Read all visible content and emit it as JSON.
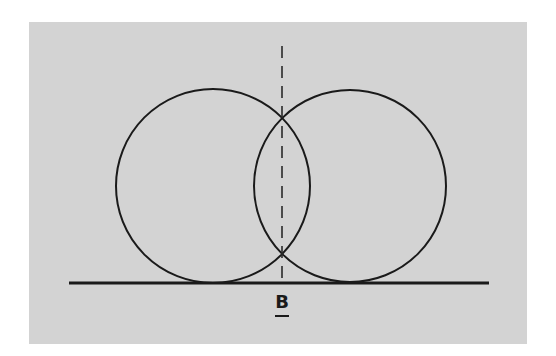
{
  "figure": {
    "label": "B",
    "label_underlined": true,
    "background_color": "#d3d3d3",
    "line_color": "#1a1a1a"
  },
  "geometry": {
    "circles": [
      {
        "name": "left-circle",
        "cx": 213,
        "cy": 186,
        "r": 97
      },
      {
        "name": "right-circle",
        "cx": 350,
        "cy": 186,
        "r": 96
      }
    ],
    "baseline": {
      "x1": 69,
      "x2": 489,
      "y": 283
    },
    "axis": {
      "x": 282,
      "y1": 46,
      "y2": 283,
      "dash": "12 8"
    }
  }
}
